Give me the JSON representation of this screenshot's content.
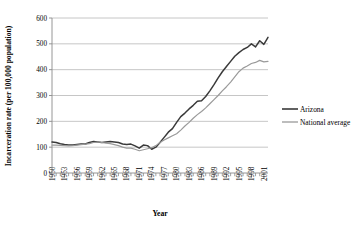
{
  "chart_data": {
    "type": "line",
    "title": "",
    "xlabel": "Year",
    "ylabel": "Incarceration rate (per 100,000 population)",
    "xlim": [
      1950,
      2002
    ],
    "ylim": [
      0,
      600
    ],
    "ytick_values": [
      0,
      100,
      200,
      300,
      400,
      500,
      600
    ],
    "ytick_labels": [
      "0",
      "100",
      "200",
      "300",
      "400",
      "500",
      "600"
    ],
    "xtick_labels": [
      "1950",
      "1953",
      "1956",
      "1959",
      "1962",
      "1965",
      "1968",
      "1971",
      "1974",
      "1977",
      "1980",
      "1983",
      "1986",
      "1989",
      "1992",
      "1995",
      "1998",
      "2001"
    ],
    "grid": "horizontal",
    "legend_position": "right",
    "x": [
      1950,
      1951,
      1952,
      1953,
      1954,
      1955,
      1956,
      1957,
      1958,
      1959,
      1960,
      1961,
      1962,
      1963,
      1964,
      1965,
      1966,
      1967,
      1968,
      1969,
      1970,
      1971,
      1972,
      1973,
      1974,
      1975,
      1976,
      1977,
      1978,
      1979,
      1980,
      1981,
      1982,
      1983,
      1984,
      1985,
      1986,
      1987,
      1988,
      1989,
      1990,
      1991,
      1992,
      1993,
      1994,
      1995,
      1996,
      1997,
      1998,
      1999,
      2000,
      2001,
      2002
    ],
    "series": [
      {
        "name": "Arizona",
        "color": "#3a3a3a",
        "values": [
          120,
          118,
          113,
          110,
          108,
          108,
          110,
          112,
          112,
          118,
          122,
          120,
          118,
          120,
          122,
          120,
          118,
          112,
          110,
          112,
          105,
          96,
          108,
          106,
          92,
          100,
          118,
          138,
          158,
          172,
          196,
          218,
          232,
          248,
          262,
          278,
          280,
          296,
          318,
          342,
          368,
          392,
          412,
          432,
          452,
          466,
          478,
          486,
          500,
          488,
          512,
          498,
          525
        ]
      },
      {
        "name": "National average",
        "color": "#9a9a9a",
        "values": [
          108,
          108,
          107,
          106,
          105,
          106,
          108,
          110,
          112,
          114,
          118,
          120,
          118,
          116,
          114,
          110,
          106,
          100,
          96,
          96,
          92,
          86,
          90,
          94,
          98,
          106,
          118,
          128,
          136,
          144,
          152,
          166,
          182,
          196,
          212,
          226,
          238,
          252,
          268,
          284,
          300,
          318,
          334,
          352,
          372,
          392,
          406,
          414,
          424,
          428,
          436,
          430,
          432
        ]
      }
    ]
  },
  "legend": {
    "items": [
      {
        "label": "Arizona",
        "color": "#3a3a3a"
      },
      {
        "label": "National average",
        "color": "#9a9a9a"
      }
    ]
  }
}
